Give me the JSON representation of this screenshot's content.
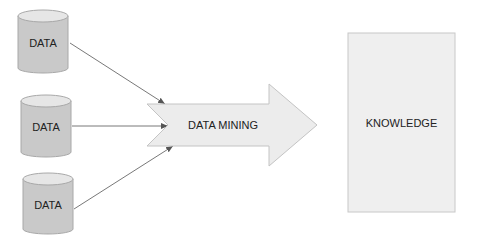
{
  "diagram": {
    "sources": [
      {
        "label": "DATA"
      },
      {
        "label": "DATA"
      },
      {
        "label": "DATA"
      }
    ],
    "process": {
      "label": "DATA MINING"
    },
    "output": {
      "label": "KNOWLEDGE"
    },
    "colors": {
      "cylinder_fill": "#c9c9c9",
      "cylinder_top": "#e6e6e6",
      "cylinder_stroke": "#a8a8a8",
      "arrow_fill": "#ececec",
      "arrow_stroke": "#c4c4c4",
      "box_fill": "#efefef",
      "box_stroke": "#c8c8c8",
      "connector": "#555555"
    }
  }
}
